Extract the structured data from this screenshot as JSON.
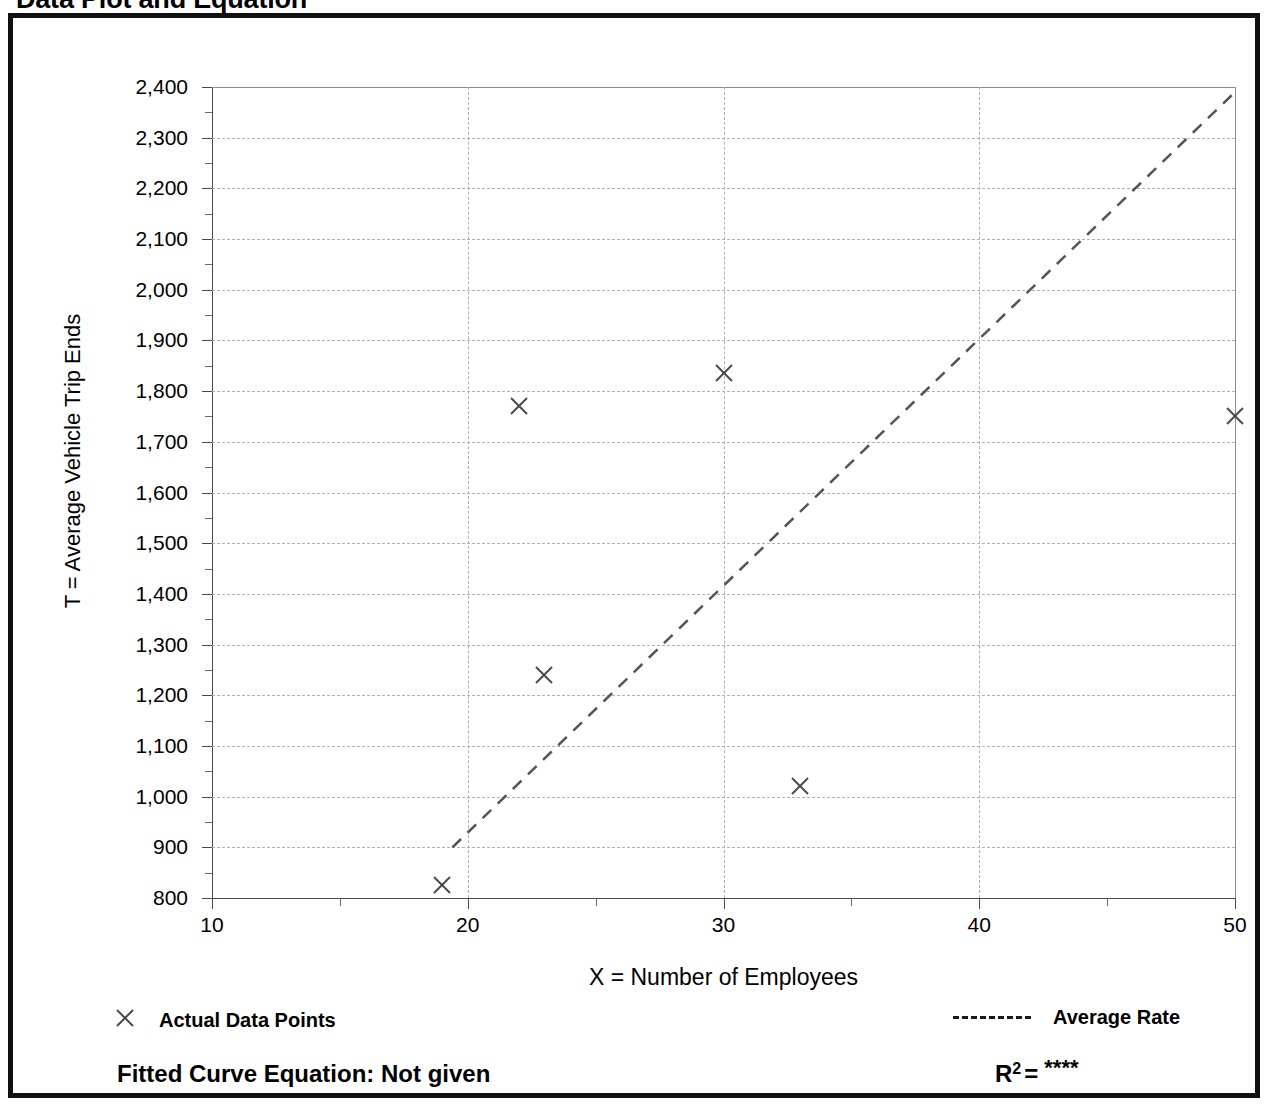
{
  "page": {
    "title": "Data Plot and Equation"
  },
  "legend": {
    "points_label": "Actual Data Points",
    "points_marker": "x-marker-icon",
    "line_label": "Average Rate",
    "line_marker": "dashed-line-icon"
  },
  "equation": {
    "fitted_label": "Fitted Curve Equation:  Not given",
    "r_symbol": "R",
    "r_exponent": "2",
    "r_equals": "=",
    "r_value": "****"
  },
  "chart_data": {
    "type": "scatter",
    "title": "Data Plot and Equation",
    "xlabel": "X = Number of Employees",
    "ylabel": "T = Average Vehicle Trip Ends",
    "xlim": [
      10,
      50
    ],
    "ylim": [
      800,
      2400
    ],
    "xticks": [
      10,
      20,
      30,
      40,
      50
    ],
    "xtick_labels": [
      "10",
      "20",
      "30",
      "40",
      "50"
    ],
    "xminor_ticks": [
      15,
      25,
      35,
      45
    ],
    "yticks": [
      800,
      900,
      1000,
      1100,
      1200,
      1300,
      1400,
      1500,
      1600,
      1700,
      1800,
      1900,
      2000,
      2100,
      2200,
      2300,
      2400
    ],
    "ytick_labels": [
      "800",
      "900",
      "1,000",
      "1,100",
      "1,200",
      "1,300",
      "1,400",
      "1,500",
      "1,600",
      "1,700",
      "1,800",
      "1,900",
      "2,000",
      "2,100",
      "2,200",
      "2,300",
      "2,400"
    ],
    "yminor_ticks": [
      850,
      950,
      1050,
      1150,
      1250,
      1350,
      1450,
      1550,
      1650,
      1750,
      1850,
      1950,
      2050,
      2150,
      2250,
      2350
    ],
    "grid": true,
    "grid_style": "dotted",
    "legend_position": "below-plot",
    "series": [
      {
        "name": "Actual Data Points",
        "type": "scatter",
        "marker": "x",
        "color": "#4a4a4a",
        "points": [
          {
            "x": 19,
            "y": 825
          },
          {
            "x": 22,
            "y": 1770
          },
          {
            "x": 23,
            "y": 1240
          },
          {
            "x": 30,
            "y": 1835
          },
          {
            "x": 33,
            "y": 1020
          },
          {
            "x": 50,
            "y": 1750
          }
        ]
      },
      {
        "name": "Average Rate",
        "type": "line",
        "style": "dashed",
        "color": "#555555",
        "points": [
          {
            "x": 19.4,
            "y": 900
          },
          {
            "x": 50,
            "y": 2390
          }
        ]
      }
    ]
  }
}
